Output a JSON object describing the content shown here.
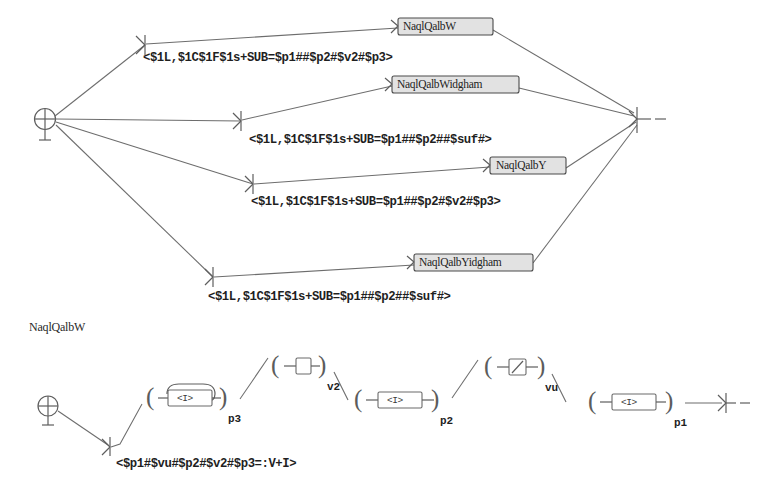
{
  "figure": {
    "title": "NaqlQalbW",
    "background_color": "#ffffff",
    "line_color": "#6d6d6d",
    "state_fill_color": "#e2e2e2"
  },
  "upper_graph": {
    "name": "top-transducer-network",
    "start_node": {
      "icon": "start-circle-cross-icon"
    },
    "end_node": {
      "icon": "end-arrowhead-bar-icon"
    },
    "states": [
      {
        "id": "s1",
        "label": "NaqlQalbW"
      },
      {
        "id": "s2",
        "label": "NaqlQalbWidgham"
      },
      {
        "id": "s3",
        "label": "NaqlQalbY"
      },
      {
        "id": "s4",
        "label": "NaqlQalbYidgham"
      }
    ],
    "arc_labels": [
      {
        "id": "a1",
        "text": "<$1L,$1C$1F$1s+SUB=$p1##$p2#$v2#$p3>"
      },
      {
        "id": "a2",
        "text": "<$1L,$1C$1F$1s+SUB=$p1##$p2##$suf#>"
      },
      {
        "id": "a3",
        "text": "<$1L,$1C$1F$1s+SUB=$p1##$p2#$v2#$p3>"
      },
      {
        "id": "a4",
        "text": "<$1L,$1C$1F$1s+SUB=$p1##$p2##$suf#>"
      }
    ]
  },
  "lower_graph": {
    "name": "naqlqalbw-expansion",
    "caption": "NaqlQalbW",
    "start_node": {
      "icon": "start-circle-cross-icon"
    },
    "end_node": {
      "icon": "end-arrowhead-bar-icon"
    },
    "transition_label": "<$p1#$vu#$p2#$v2#$p3=:V+I>",
    "groups": [
      {
        "id": "g1",
        "sub": "p3",
        "box_text": "<I>",
        "has_loop": true,
        "open": "(",
        "close": ")"
      },
      {
        "id": "g2",
        "sub": "v2",
        "box_text": "",
        "has_loop": false,
        "open": "(",
        "close": ")"
      },
      {
        "id": "g3",
        "sub": "p2",
        "box_text": "<I>",
        "has_loop": false,
        "open": "(",
        "close": ")"
      },
      {
        "id": "g4",
        "sub": "vu",
        "box_text": "/",
        "has_loop": false,
        "open": "(",
        "close": ")"
      },
      {
        "id": "g5",
        "sub": "p1",
        "box_text": "<I>",
        "has_loop": false,
        "open": "(",
        "close": ")"
      }
    ]
  }
}
